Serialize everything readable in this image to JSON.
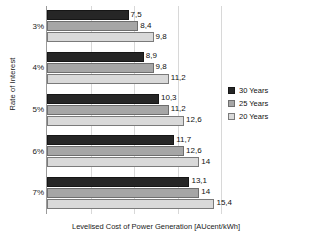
{
  "chart_data": {
    "type": "bar",
    "orientation": "horizontal",
    "title": "",
    "xlabel": "Levelised Cost of Power Generation [AUcent/kWh]",
    "ylabel": "Rate of Interest",
    "categories": [
      "3%",
      "4%",
      "5%",
      "6%",
      "7%"
    ],
    "series": [
      {
        "name": "30 Years",
        "color": "#262626",
        "values": [
          7.5,
          8.9,
          10.3,
          11.7,
          13.1
        ],
        "labels": [
          "7,5",
          "8,9",
          "10,3",
          "11,7",
          "13,1"
        ]
      },
      {
        "name": "25 Years",
        "color": "#a6a6a6",
        "values": [
          8.4,
          9.8,
          11.2,
          12.6,
          14
        ],
        "labels": [
          "8,4",
          "9,8",
          "11,2",
          "12,6",
          "14"
        ]
      },
      {
        "name": "20 Years",
        "color": "#d9d9d9",
        "values": [
          9.8,
          11.2,
          12.6,
          14,
          15.4
        ],
        "labels": [
          "9,8",
          "11,2",
          "12,6",
          "14",
          "15,4"
        ]
      }
    ],
    "xlim": [
      0,
      16
    ],
    "grid": true,
    "gridlines": [
      4,
      8,
      12,
      16
    ],
    "legend_position": "right",
    "decimal_separator": ","
  },
  "legend": {
    "items": [
      {
        "label": "30 Years"
      },
      {
        "label": "25 Years"
      },
      {
        "label": "20 Years"
      }
    ]
  }
}
